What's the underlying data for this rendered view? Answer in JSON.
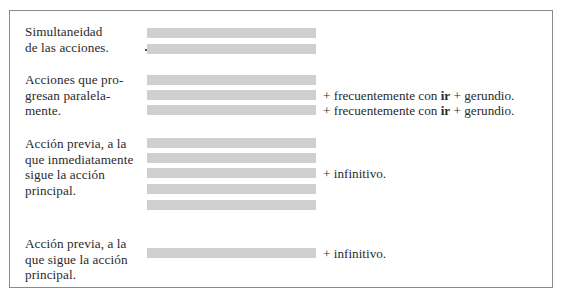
{
  "table": {
    "rows": [
      {
        "label": "Simultaneidad\nde las acciones.",
        "bar_count": 2,
        "notes": []
      },
      {
        "label": "Acciones que pro-\ngresan paralela-\nmente.",
        "bar_count": 3,
        "notes": [
          {
            "bar_index": 1,
            "prefix": "+ frecuentemente con ",
            "bold": "ir",
            "suffix": " + gerundio."
          },
          {
            "bar_index": 2,
            "prefix": "+ frecuentemente con ",
            "bold": "ir",
            "suffix": " + gerundio."
          }
        ]
      },
      {
        "label": "Acción previa, a la\nque inmediatamente\nsigue la acción\nprincipal.",
        "bar_count": 5,
        "notes": [
          {
            "bar_index": 2,
            "prefix": "+ infinitivo.",
            "bold": "",
            "suffix": ""
          }
        ]
      },
      {
        "label": "Acción previa, a la\nque sigue la acción\nprincipal.",
        "bar_count": 1,
        "notes": [
          {
            "bar_index": 0,
            "prefix": "+ infinitivo.",
            "bold": "",
            "suffix": ""
          }
        ]
      }
    ]
  },
  "colors": {
    "bar": "#cfcfcf",
    "border": "#8a8a8a",
    "text": "#2a2a2a"
  }
}
